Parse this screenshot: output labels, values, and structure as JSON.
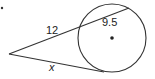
{
  "diagram": {
    "type": "geometry-secant-tangent",
    "labels": {
      "secant_external": "12",
      "chord_internal": "9.5",
      "tangent": "x"
    },
    "colors": {
      "stroke": "#333333",
      "background": "#ffffff"
    }
  }
}
